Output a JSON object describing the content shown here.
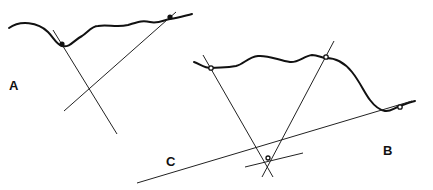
{
  "figure": {
    "panels": [
      {
        "id": "A",
        "label": "A",
        "description": "Two points on terrain profile with sight lines intersecting below",
        "point_count": 2,
        "marker": "solid"
      },
      {
        "id": "B",
        "label": "B",
        "description": "Three points on terrain profile with sight lines converging",
        "point_count": 3,
        "marker": "open"
      },
      {
        "id": "C",
        "label": "C",
        "description": "Convergence region of three lines (triangle of error)"
      }
    ],
    "colors": {
      "ink": "#111111",
      "background": "#ffffff"
    }
  }
}
